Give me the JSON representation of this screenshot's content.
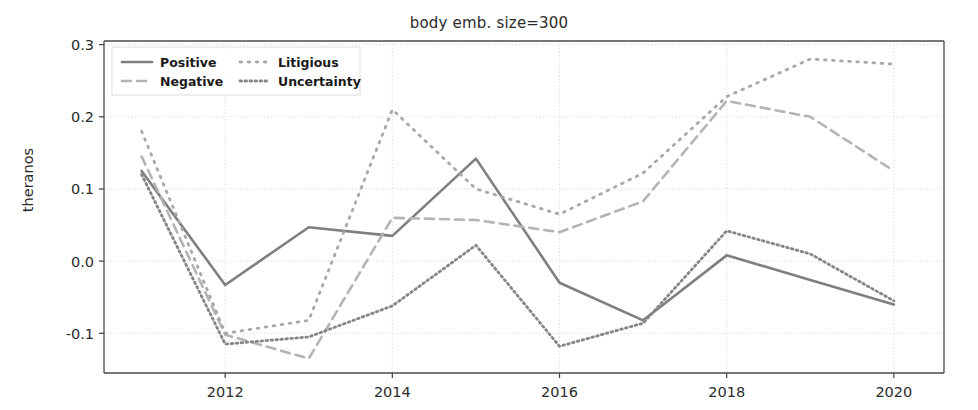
{
  "chart_data": {
    "type": "line",
    "title": "body emb. size=300",
    "xlabel": "",
    "ylabel": "theranos",
    "x": [
      2011,
      2012,
      2013,
      2014,
      2015,
      2016,
      2017,
      2018,
      2019,
      2020
    ],
    "xlim": [
      2010.55,
      2020.6
    ],
    "ylim": [
      -0.155,
      0.305
    ],
    "xticks": [
      2012,
      2014,
      2016,
      2018,
      2020
    ],
    "xtick_labels": [
      "2012",
      "2014",
      "2016",
      "2018",
      "2020"
    ],
    "yticks": [
      -0.1,
      0.0,
      0.1,
      0.2,
      0.3
    ],
    "ytick_labels": [
      "-0.1",
      "0.0",
      "0.1",
      "0.2",
      "0.3"
    ],
    "grid": true,
    "legend_position": "upper left",
    "series": [
      {
        "name": "Positive",
        "style": "solid",
        "color": "#7f7f7f",
        "values": [
          0.125,
          -0.033,
          0.047,
          0.035,
          0.142,
          -0.03,
          -0.082,
          0.008,
          -0.026,
          -0.06
        ]
      },
      {
        "name": "Negative",
        "style": "dashed",
        "color": "#b4b4b4",
        "values": [
          0.145,
          -0.102,
          -0.135,
          0.06,
          0.057,
          0.04,
          0.083,
          0.222,
          0.2,
          0.125
        ]
      },
      {
        "name": "Litigious",
        "style": "loosely-dotted",
        "color": "#a8a8a8",
        "values": [
          0.18,
          -0.1,
          -0.082,
          0.21,
          0.1,
          0.065,
          0.122,
          0.228,
          0.28,
          0.273
        ]
      },
      {
        "name": "Uncertainty",
        "style": "dotted",
        "color": "#868686",
        "values": [
          0.12,
          -0.115,
          -0.105,
          -0.062,
          0.022,
          -0.118,
          -0.086,
          0.042,
          0.01,
          -0.055
        ]
      }
    ]
  },
  "legend": {
    "entries": [
      "Positive",
      "Negative",
      "Litigious",
      "Uncertainty"
    ]
  },
  "axes": {
    "title": "body emb. size=300",
    "ylabel": "theranos"
  }
}
